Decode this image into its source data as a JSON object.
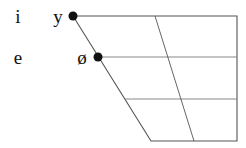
{
  "diagram": {
    "type": "vowel-chart",
    "colors": {
      "line": "#555555",
      "grid_line": "#888888",
      "dot": "#111111",
      "text": "#111111",
      "background": "#ffffff"
    },
    "labels": [
      {
        "id": "i",
        "text": "i",
        "x": 18,
        "y": 16
      },
      {
        "id": "y",
        "text": "y",
        "x": 58,
        "y": 16
      },
      {
        "id": "e",
        "text": "e",
        "x": 18,
        "y": 57
      },
      {
        "id": "o-slash",
        "text": "ø",
        "x": 82,
        "y": 57
      }
    ],
    "dots": [
      {
        "id": "y",
        "x": 73,
        "y": 16
      },
      {
        "id": "o-slash",
        "x": 98,
        "y": 57
      }
    ],
    "frame": {
      "top_left": [
        73,
        16
      ],
      "top_right": [
        237,
        16
      ],
      "bottom_right": [
        237,
        141
      ],
      "bottom_left": [
        151,
        141
      ]
    },
    "horizontals": [
      {
        "y": 57,
        "x1": 98,
        "x2": 237
      },
      {
        "y": 99,
        "x1": 125,
        "x2": 237
      }
    ],
    "central_line": {
      "x1": 155,
      "y1": 16,
      "x2": 194,
      "y2": 141
    }
  }
}
